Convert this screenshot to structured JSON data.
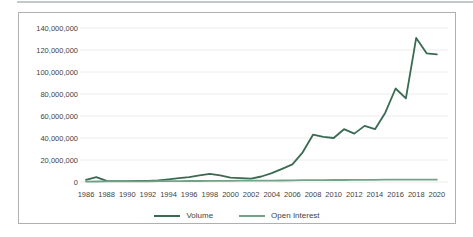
{
  "page": {
    "background_color": "#ffffff",
    "frame_border_color": "#b0b0b0",
    "gridline_color": "#ececec",
    "tick_text_color": "#3f3f3f"
  },
  "chart_data": {
    "type": "line",
    "title": "",
    "xlabel": "",
    "ylabel": "",
    "x": [
      1986,
      1987,
      1988,
      1989,
      1990,
      1991,
      1992,
      1993,
      1994,
      1995,
      1996,
      1997,
      1998,
      1999,
      2000,
      2001,
      2002,
      2003,
      2004,
      2005,
      2006,
      2007,
      2008,
      2009,
      2010,
      2011,
      2012,
      2013,
      2014,
      2015,
      2016,
      2017,
      2018,
      2019,
      2020
    ],
    "series": [
      {
        "name": "Volume",
        "color": "#3a6b52",
        "values": [
          2000000,
          4500000,
          1000000,
          800000,
          800000,
          900000,
          1000000,
          1500000,
          2500000,
          3500000,
          4500000,
          6000000,
          7500000,
          6000000,
          4000000,
          3500000,
          3000000,
          5000000,
          8000000,
          12000000,
          16000000,
          27000000,
          43000000,
          41000000,
          40000000,
          48000000,
          44000000,
          51000000,
          48000000,
          63000000,
          85000000,
          76000000,
          131000000,
          117000000,
          116000000
        ]
      },
      {
        "name": "Open Interest",
        "color": "#74a289",
        "values": [
          400000,
          450000,
          500000,
          500000,
          550000,
          600000,
          650000,
          700000,
          750000,
          800000,
          900000,
          950000,
          1000000,
          1050000,
          1100000,
          1150000,
          1200000,
          1250000,
          1300000,
          1400000,
          1500000,
          1600000,
          1700000,
          1750000,
          1800000,
          1850000,
          1900000,
          1950000,
          2000000,
          2050000,
          2100000,
          2150000,
          2200000,
          2200000,
          2200000
        ]
      }
    ],
    "yticks": [
      {
        "label": "140,000,000",
        "value": 140000000
      },
      {
        "label": "120,000,000",
        "value": 120000000
      },
      {
        "label": "100,000,000",
        "value": 100000000
      },
      {
        "label": "80,000,000",
        "value": 80000000
      },
      {
        "label": "60,000,000",
        "value": 60000000
      },
      {
        "label": "40,000,000",
        "value": 40000000
      },
      {
        "label": "20,000,000",
        "value": 20000000
      },
      {
        "label": "0",
        "value": 0
      }
    ],
    "xticks": [
      "1986",
      "1988",
      "1990",
      "1992",
      "1994",
      "1996",
      "1998",
      "2000",
      "2002",
      "2004",
      "2006",
      "2008",
      "2010",
      "2012",
      "2014",
      "2016",
      "2018",
      "2020"
    ],
    "ylim": [
      0,
      140000000
    ],
    "grid": true,
    "legend_position": "bottom-center"
  }
}
